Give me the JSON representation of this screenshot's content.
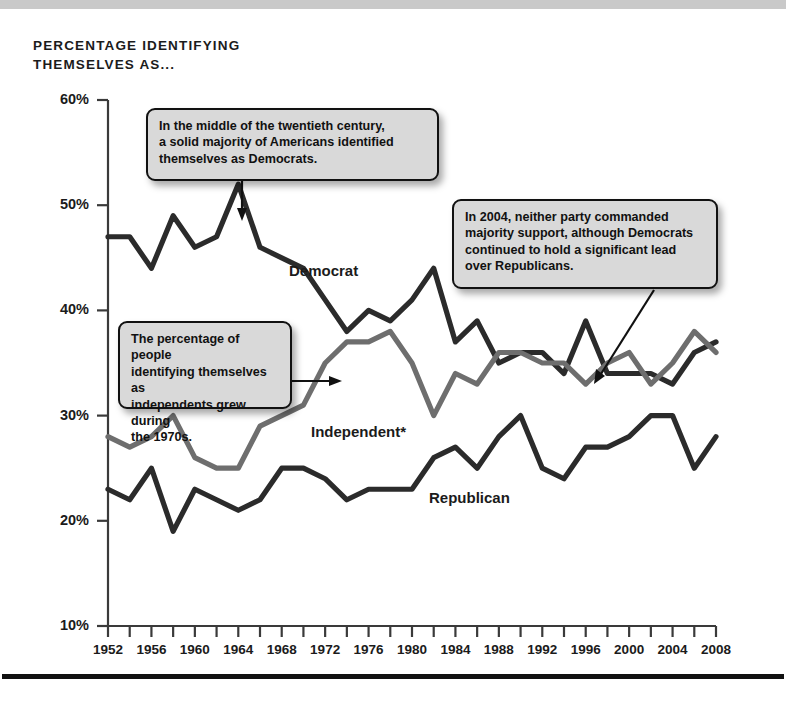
{
  "figure": {
    "title": "PERCENTAGE IDENTIFYING\nTHEMSELVES AS..."
  },
  "callouts": [
    {
      "id": "democrat-majority",
      "text": "In the middle of the twentieth century,\na solid majority of Americans identified\nthemselves as Democrats."
    },
    {
      "id": "independents-1970s",
      "text": "The percentage of people\nidentifying themselves as\nindependents grew during\nthe 1970s."
    },
    {
      "id": "year-2004",
      "text": "In 2004, neither party commanded\nmajority support, although Democrats\ncontinued to hold a significant lead\nover Republicans."
    }
  ],
  "series_labels": {
    "democrat": "Democrat",
    "independent": "Independent*",
    "republican": "Republican"
  },
  "colors": {
    "democrat": "#2b2b2b",
    "republican": "#2b2b2b",
    "independent": "#6e6e6e",
    "axis": "#3a3a3a",
    "callout_fill": "#d9d9d9",
    "callout_border": "#111111",
    "top_band": "#c9c9c9"
  },
  "chart_data": {
    "type": "line",
    "title": "PERCENTAGE IDENTIFYING THEMSELVES AS...",
    "xlabel": "",
    "ylabel": "",
    "xlim": [
      1952,
      2008
    ],
    "ylim": [
      10,
      60
    ],
    "yticks": [
      "10%",
      "20%",
      "30%",
      "40%",
      "50%",
      "60%"
    ],
    "ytick_values": [
      10,
      20,
      30,
      40,
      50,
      60
    ],
    "xticks": [
      "1952",
      "1956",
      "1960",
      "1964",
      "1968",
      "1972",
      "1976",
      "1980",
      "1984",
      "1988",
      "1992",
      "1996",
      "2000",
      "2004",
      "2008"
    ],
    "xtick_values": [
      1952,
      1956,
      1960,
      1964,
      1968,
      1972,
      1976,
      1980,
      1984,
      1988,
      1992,
      1996,
      2000,
      2004,
      2008
    ],
    "minor_tick_interval": 2,
    "grid": false,
    "legend": "inline-labels",
    "x": [
      1952,
      1954,
      1956,
      1958,
      1960,
      1962,
      1964,
      1966,
      1968,
      1970,
      1972,
      1974,
      1976,
      1978,
      1980,
      1982,
      1984,
      1986,
      1988,
      1990,
      1992,
      1994,
      1996,
      1998,
      2000,
      2002,
      2004,
      2006,
      2008
    ],
    "series": [
      {
        "name": "Democrat",
        "values": [
          47,
          47,
          44,
          49,
          46,
          47,
          52,
          46,
          45,
          44,
          41,
          38,
          40,
          39,
          41,
          44,
          37,
          39,
          35,
          36,
          36,
          34,
          39,
          34,
          34,
          34,
          33,
          36,
          37
        ]
      },
      {
        "name": "Independent*",
        "values": [
          28,
          27,
          28,
          30,
          26,
          25,
          25,
          29,
          30,
          31,
          35,
          37,
          37,
          38,
          35,
          30,
          34,
          33,
          36,
          36,
          35,
          35,
          33,
          35,
          36,
          33,
          35,
          38,
          36
        ]
      },
      {
        "name": "Republican",
        "values": [
          23,
          22,
          25,
          19,
          23,
          22,
          21,
          22,
          25,
          25,
          24,
          22,
          23,
          23,
          23,
          26,
          27,
          25,
          28,
          30,
          25,
          24,
          27,
          27,
          28,
          30,
          30,
          25,
          28
        ]
      }
    ],
    "annotations": [
      "In the middle of the twentieth century, a solid majority of Americans identified themselves as Democrats.",
      "The percentage of people identifying themselves as independents grew during the 1970s.",
      "In 2004, neither party commanded majority support, although Democrats continued to hold a significant lead over Republicans."
    ]
  }
}
